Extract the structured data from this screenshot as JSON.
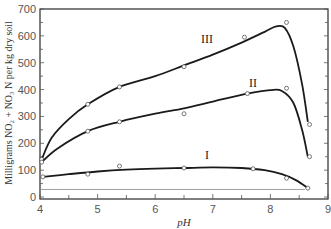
{
  "chart_data": {
    "type": "line",
    "title": "",
    "xlabel": "pH",
    "ylabel": "Milligrams NO2 + NO3 N per kg dry soil",
    "xlim": [
      4,
      9
    ],
    "ylim": [
      0,
      700
    ],
    "x_ticks": [
      4,
      5,
      6,
      7,
      8,
      9
    ],
    "y_ticks": [
      0,
      100,
      200,
      300,
      400,
      500,
      600,
      700
    ],
    "grid": false,
    "legend": "inline labels",
    "reference_line_y": 28,
    "series": [
      {
        "name": "III",
        "label_pos": {
          "x": 6.9,
          "y": 575
        },
        "curve": [
          [
            4.03,
            140
          ],
          [
            4.2,
            220
          ],
          [
            4.5,
            290
          ],
          [
            4.83,
            345
          ],
          [
            5.38,
            410
          ],
          [
            6.0,
            450
          ],
          [
            6.5,
            490
          ],
          [
            7.0,
            530
          ],
          [
            7.5,
            575
          ],
          [
            7.9,
            615
          ],
          [
            8.1,
            635
          ],
          [
            8.25,
            630
          ],
          [
            8.4,
            560
          ],
          [
            8.55,
            420
          ],
          [
            8.65,
            280
          ]
        ],
        "points": [
          [
            4.03,
            140
          ],
          [
            4.83,
            345
          ],
          [
            5.38,
            410
          ],
          [
            6.5,
            485
          ],
          [
            7.55,
            595
          ],
          [
            8.28,
            650
          ],
          [
            8.68,
            270
          ]
        ]
      },
      {
        "name": "II",
        "label_pos": {
          "x": 7.7,
          "y": 410
        },
        "curve": [
          [
            4.03,
            130
          ],
          [
            4.3,
            180
          ],
          [
            4.83,
            245
          ],
          [
            5.38,
            280
          ],
          [
            6.0,
            310
          ],
          [
            6.5,
            330
          ],
          [
            7.0,
            355
          ],
          [
            7.6,
            385
          ],
          [
            8.0,
            398
          ],
          [
            8.2,
            395
          ],
          [
            8.4,
            350
          ],
          [
            8.55,
            250
          ],
          [
            8.65,
            150
          ]
        ],
        "points": [
          [
            4.03,
            130
          ],
          [
            4.83,
            245
          ],
          [
            5.38,
            280
          ],
          [
            6.5,
            310
          ],
          [
            7.6,
            385
          ],
          [
            8.28,
            405
          ],
          [
            8.68,
            150
          ]
        ]
      },
      {
        "name": "I",
        "label_pos": {
          "x": 6.9,
          "y": 140
        },
        "curve": [
          [
            4.05,
            75
          ],
          [
            4.5,
            85
          ],
          [
            5.0,
            95
          ],
          [
            5.5,
            102
          ],
          [
            6.0,
            106
          ],
          [
            6.5,
            108
          ],
          [
            7.0,
            110
          ],
          [
            7.5,
            108
          ],
          [
            7.9,
            100
          ],
          [
            8.2,
            85
          ],
          [
            8.45,
            62
          ],
          [
            8.65,
            33
          ]
        ],
        "points": [
          [
            4.05,
            75
          ],
          [
            4.83,
            85
          ],
          [
            5.38,
            115
          ],
          [
            6.5,
            108
          ],
          [
            7.7,
            105
          ],
          [
            8.28,
            70
          ],
          [
            8.65,
            33
          ]
        ]
      }
    ]
  },
  "axes": {
    "x_tick_labels": [
      "4",
      "5",
      "6",
      "7",
      "8",
      "9"
    ],
    "y_tick_labels": [
      "0",
      "100",
      "200",
      "300",
      "400",
      "500",
      "600",
      "700"
    ],
    "xlabel": "pH",
    "ylabel": "Milligrams NO₂ + NO₃ N per kg dry soil"
  }
}
